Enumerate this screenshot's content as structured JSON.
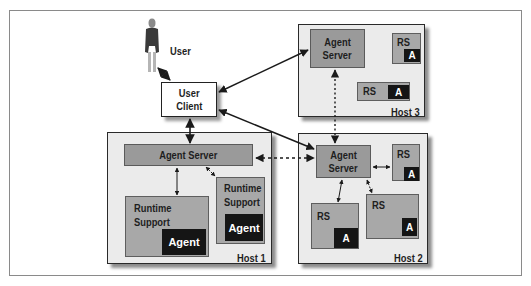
{
  "diagram": {
    "user": {
      "label": "User",
      "icon": "person-icon"
    },
    "user_client": {
      "line1": "User",
      "line2": "Client"
    },
    "host1": {
      "label": "Host 1",
      "agent_server": "Agent Server",
      "runtime_support_a": {
        "line1": "Runtime",
        "line2": "Support",
        "agent": "Agent"
      },
      "runtime_support_b": {
        "line1": "Runtime",
        "line2": "Support",
        "agent": "Agent"
      }
    },
    "host2": {
      "label": "Host 2",
      "agent_server": {
        "line1": "Agent",
        "line2": "Server"
      },
      "rs_top_right": {
        "label": "RS",
        "agent": "A"
      },
      "rs_bottom_left": {
        "label": "RS",
        "agent": "A"
      },
      "rs_bottom_right": {
        "label": "RS",
        "agent": "A"
      }
    },
    "host3": {
      "label": "Host 3",
      "agent_server": {
        "line1": "Agent",
        "line2": "Server"
      },
      "rs_top": {
        "label": "RS",
        "agent": "A"
      },
      "rs_bottom": {
        "label": "RS",
        "agent": "A"
      }
    },
    "colors": {
      "host_bg": "#ebebeb",
      "server_bg": "#9a9a9a",
      "runtime_bg": "#a8a8a8",
      "agent_bg": "#151515",
      "border": "#2a2a2a"
    },
    "connections": [
      {
        "from": "user",
        "to": "user_client",
        "style": "solid",
        "direction": "bidirectional"
      },
      {
        "from": "user_client",
        "to": "host1.agent_server",
        "style": "solid",
        "direction": "bidirectional"
      },
      {
        "from": "user_client",
        "to": "host3.agent_server",
        "style": "solid",
        "direction": "bidirectional"
      },
      {
        "from": "user_client",
        "to": "host2.agent_server",
        "style": "solid",
        "direction": "bidirectional"
      },
      {
        "from": "host1.agent_server",
        "to": "host2.agent_server",
        "style": "dashed",
        "direction": "bidirectional"
      },
      {
        "from": "host3.agent_server",
        "to": "host2.agent_server",
        "style": "dashed",
        "direction": "bidirectional"
      },
      {
        "from": "host1.agent_server",
        "to": "host1.runtime_support_a",
        "style": "solid",
        "direction": "bidirectional"
      },
      {
        "from": "host1.agent_server",
        "to": "host1.runtime_support_b",
        "style": "dashed",
        "direction": "bidirectional"
      },
      {
        "from": "host2.agent_server",
        "to": "host2.rs_top_right",
        "style": "solid",
        "direction": "bidirectional"
      },
      {
        "from": "host2.agent_server",
        "to": "host2.rs_bottom_left",
        "style": "solid",
        "direction": "bidirectional"
      },
      {
        "from": "host2.agent_server",
        "to": "host2.rs_bottom_right",
        "style": "dashed",
        "direction": "bidirectional"
      }
    ]
  }
}
